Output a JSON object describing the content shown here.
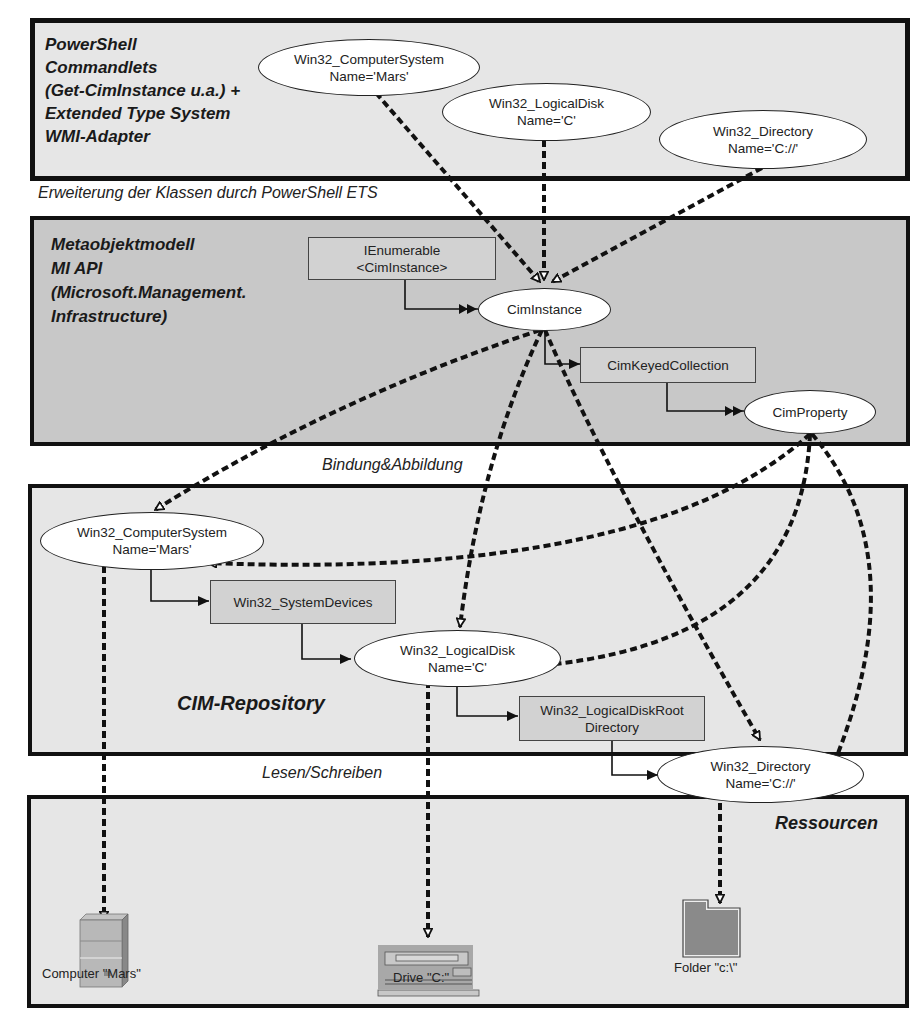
{
  "layers": {
    "powershell": {
      "title": "PowerShell\nCommandlets\n(Get-CimInstance u.a.) +\nExtended Type System\nWMI-Adapter"
    },
    "metaobject": {
      "title": "Metaobjektmodell\nMI API\n(Microsoft.Management.\nInfrastructure)"
    },
    "repository": {
      "title": "CIM-Repository"
    },
    "resources": {
      "title": "Ressourcen"
    }
  },
  "captions": {
    "ets": "Erweiterung der Klassen durch PowerShell ETS",
    "binding": "Bindung&Abbildung",
    "readwrite": "Lesen/Schreiben"
  },
  "nodes": {
    "ps_computersystem": {
      "line1": "Win32_ComputerSystem",
      "line2": "Name='Mars'"
    },
    "ps_logicaldisk": {
      "line1": "Win32_LogicalDisk",
      "line2": "Name='C'"
    },
    "ps_directory": {
      "line1": "Win32_Directory",
      "line2": "Name='C://'"
    },
    "ienumerable": {
      "line1": "IEnumerable",
      "line2": "<CimInstance>"
    },
    "ciminstance": {
      "line1": "CimInstance"
    },
    "cimkeyedcollection": {
      "line1": "CimKeyedCollection"
    },
    "cimproperty": {
      "line1": "CimProperty"
    },
    "repo_computersystem": {
      "line1": "Win32_ComputerSystem",
      "line2": "Name='Mars'"
    },
    "systemdevices": {
      "line1": "Win32_SystemDevices"
    },
    "repo_logicaldisk": {
      "line1": "Win32_LogicalDisk",
      "line2": "Name='C'"
    },
    "logicaldiskroot": {
      "line1": "Win32_LogicalDiskRoot",
      "line2": "Directory"
    },
    "repo_directory": {
      "line1": "Win32_Directory",
      "line2": "Name='C://'"
    }
  },
  "resources": {
    "computer": {
      "label": "Computer \"Mars\"",
      "icon": "server-icon"
    },
    "drive": {
      "label": "Drive \"C:\"",
      "icon": "disk-drive-icon"
    },
    "folder": {
      "label": "Folder \"c:\\\"",
      "icon": "folder-icon"
    }
  },
  "colors": {
    "layer_light": "#e6e6e6",
    "layer_dark": "#c8c8c8",
    "box_fill": "#d2d2d2",
    "ellipse_fill": "#ffffff",
    "line": "#111111"
  }
}
